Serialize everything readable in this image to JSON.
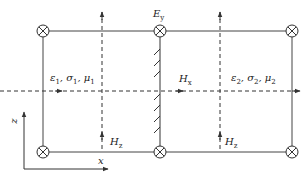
{
  "diagram": {
    "type": "electromagnetic-field-cell-layout",
    "colors": {
      "line": "#333333",
      "background": "#ffffff"
    },
    "labels": {
      "e_field": {
        "symbol": "E",
        "sub": "y"
      },
      "h_tangential": {
        "symbol": "H",
        "sub": "x"
      },
      "h_normal_left": {
        "symbol": "H",
        "sub": "z"
      },
      "h_normal_right": {
        "symbol": "H",
        "sub": "z"
      },
      "medium1": {
        "text": "ε",
        "sub1": "1",
        "sep": ", σ",
        "sub2": "1",
        "sep2": ", μ",
        "sub3": "1"
      },
      "medium2": {
        "text": "ε",
        "sub1": "2",
        "sep": ", σ",
        "sub2": "2",
        "sep2": ", μ",
        "sub3": "2"
      },
      "axis_x": "x",
      "axis_z": "z"
    },
    "nodes": [
      {
        "name": "node-top-left",
        "x": 43,
        "y": 31
      },
      {
        "name": "node-top-center",
        "x": 160,
        "y": 31
      },
      {
        "name": "node-top-right",
        "x": 292,
        "y": 31
      },
      {
        "name": "node-bottom-left",
        "x": 43,
        "y": 152
      },
      {
        "name": "node-bottom-center",
        "x": 160,
        "y": 152
      },
      {
        "name": "node-bottom-right",
        "x": 292,
        "y": 152
      }
    ],
    "icons": {
      "node": "circle-cross-icon"
    }
  }
}
